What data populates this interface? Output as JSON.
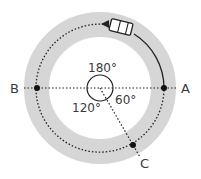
{
  "diagram": {
    "center": {
      "x": 100,
      "y": 88
    },
    "track": {
      "outer_radius": 76,
      "inner_radius": 51,
      "color": "#d6d6d6"
    },
    "path_radius": 64,
    "center_circle_radius": 13,
    "points": [
      {
        "id": "A",
        "label": "A",
        "angle_deg": 0
      },
      {
        "id": "B",
        "label": "B",
        "angle_deg": 180
      },
      {
        "id": "C",
        "label": "C",
        "angle_deg": -60
      }
    ],
    "angles": [
      {
        "label": "180°"
      },
      {
        "label": "120°"
      },
      {
        "label": "60°"
      }
    ],
    "vehicle": {
      "label": "car",
      "position_angle_deg": 73
    },
    "colors": {
      "line": "#222222",
      "text": "#3a3a3a",
      "point": "#111111"
    }
  }
}
